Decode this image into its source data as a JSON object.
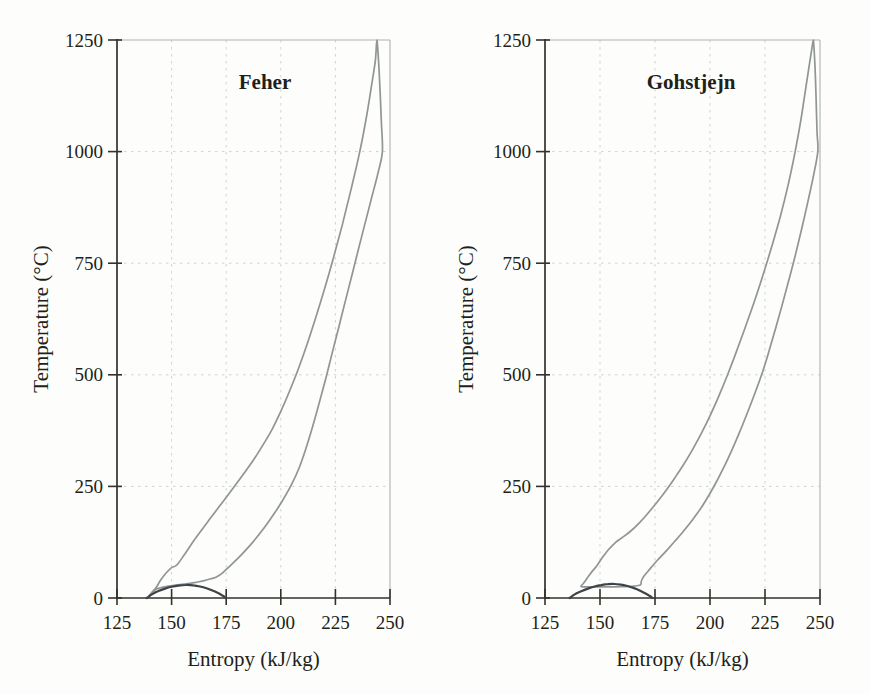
{
  "figure": {
    "background": "#fdfdfb",
    "text_color": "#211f1a",
    "axis_color": "#33312c",
    "frame_color": "#b1b1af",
    "grid_color": "#cdd3d4"
  },
  "chart_data": [
    {
      "type": "line",
      "title": "Feher",
      "xlabel": "Entropy (kJ/kg)",
      "ylabel": "Temperature (°C)",
      "xlim": [
        125,
        250
      ],
      "ylim": [
        0,
        1250
      ],
      "xticks": [
        125,
        150,
        175,
        200,
        225,
        250
      ],
      "yticks": [
        0,
        250,
        500,
        750,
        1000,
        1250
      ],
      "grid": true,
      "legend": false,
      "series": [
        {
          "name": "cycle",
          "color": "#8f9694",
          "width": 1.7,
          "closed": true,
          "points": [
            [
              139.5,
              4
            ],
            [
              141,
              13
            ],
            [
              143,
              24
            ],
            [
              145,
              40
            ],
            [
              147.5,
              56
            ],
            [
              150,
              68
            ],
            [
              152.4,
              74
            ],
            [
              156,
              98
            ],
            [
              160,
              127
            ],
            [
              164,
              154
            ],
            [
              168,
              180
            ],
            [
              172,
              206
            ],
            [
              176,
              232
            ],
            [
              180,
              258
            ],
            [
              184,
              285
            ],
            [
              188,
              313
            ],
            [
              192,
              344
            ],
            [
              196,
              378
            ],
            [
              200,
              418
            ],
            [
              204,
              463
            ],
            [
              208,
              513
            ],
            [
              212,
              568
            ],
            [
              216,
              628
            ],
            [
              220,
              692
            ],
            [
              224,
              760
            ],
            [
              228,
              833
            ],
            [
              232,
              912
            ],
            [
              236,
              996
            ],
            [
              239,
              1072
            ],
            [
              241.5,
              1146
            ],
            [
              243.3,
              1205
            ],
            [
              244,
              1250
            ],
            [
              244.9,
              1190
            ],
            [
              245.5,
              1130
            ],
            [
              246,
              1070
            ],
            [
              246.5,
              1000
            ],
            [
              244.5,
              952
            ],
            [
              241.5,
              895
            ],
            [
              238.5,
              838
            ],
            [
              235.5,
              780
            ],
            [
              232.5,
              722
            ],
            [
              229.5,
              664
            ],
            [
              226.5,
              606
            ],
            [
              223.5,
              548
            ],
            [
              220.5,
              490
            ],
            [
              217.5,
              435
            ],
            [
              214.5,
              383
            ],
            [
              211.5,
              335
            ],
            [
              208.5,
              293
            ],
            [
              205,
              255
            ],
            [
              201,
              220
            ],
            [
              197,
              189
            ],
            [
              193,
              161
            ],
            [
              189,
              136
            ],
            [
              185,
              113
            ],
            [
              181,
              92
            ],
            [
              177,
              73
            ],
            [
              173.5,
              57
            ],
            [
              170.5,
              47
            ],
            [
              168,
              43
            ],
            [
              165,
              39
            ],
            [
              161,
              35
            ],
            [
              157,
              31.8
            ],
            [
              152,
              28.8
            ],
            [
              148,
              26
            ],
            [
              145,
              23
            ],
            [
              143,
              20
            ],
            [
              141.2,
              12
            ]
          ]
        },
        {
          "name": "saturation-dome",
          "color": "#3e4347",
          "width": 2.2,
          "closed": false,
          "points": [
            [
              138.6,
              0
            ],
            [
              141,
              8
            ],
            [
              144,
              15.5
            ],
            [
              147,
              21
            ],
            [
              150,
              25
            ],
            [
              153,
              27.8
            ],
            [
              156.5,
              29.2
            ],
            [
              160,
              28.3
            ],
            [
              163,
              25.8
            ],
            [
              166,
              21.8
            ],
            [
              169,
              16.2
            ],
            [
              171.5,
              10.5
            ],
            [
              173.5,
              5
            ],
            [
              174.8,
              0
            ]
          ]
        }
      ]
    },
    {
      "type": "line",
      "title": "Gohstjejn",
      "xlabel": "Entropy (kJ/kg)",
      "ylabel": "Temperature (°C)",
      "xlim": [
        125,
        250
      ],
      "ylim": [
        0,
        1250
      ],
      "xticks": [
        125,
        150,
        175,
        200,
        225,
        250
      ],
      "yticks": [
        0,
        250,
        500,
        750,
        1000,
        1250
      ],
      "grid": true,
      "legend": false,
      "series": [
        {
          "name": "cycle",
          "color": "#8f9694",
          "width": 1.7,
          "closed": true,
          "points": [
            [
              141.3,
              26
            ],
            [
              142.5,
              33
            ],
            [
              144.5,
              47
            ],
            [
              147,
              63
            ],
            [
              148.5,
              72
            ],
            [
              151,
              90
            ],
            [
              154,
              109
            ],
            [
              157,
              124
            ],
            [
              160,
              135
            ],
            [
              164,
              150
            ],
            [
              168,
              169
            ],
            [
              172,
              191
            ],
            [
              176,
              215
            ],
            [
              180,
              241
            ],
            [
              184,
              269
            ],
            [
              188,
              299
            ],
            [
              192,
              332
            ],
            [
              196,
              368
            ],
            [
              200,
              408
            ],
            [
              204,
              452
            ],
            [
              208,
              500
            ],
            [
              212,
              552
            ],
            [
              216,
              606
            ],
            [
              220,
              662
            ],
            [
              224,
              722
            ],
            [
              228,
              786
            ],
            [
              232,
              855
            ],
            [
              235.5,
              925
            ],
            [
              238.5,
              995
            ],
            [
              241,
              1062
            ],
            [
              243,
              1125
            ],
            [
              245,
              1190
            ],
            [
              246.5,
              1237
            ],
            [
              247,
              1250
            ],
            [
              247.7,
              1195
            ],
            [
              248.1,
              1140
            ],
            [
              248.4,
              1085
            ],
            [
              248.7,
              1040
            ],
            [
              249,
              1000
            ],
            [
              247,
              945
            ],
            [
              244.5,
              888
            ],
            [
              241.8,
              830
            ],
            [
              239,
              772
            ],
            [
              236,
              715
            ],
            [
              233,
              660
            ],
            [
              230,
              607
            ],
            [
              227,
              556
            ],
            [
              224,
              508
            ],
            [
              220.5,
              460
            ],
            [
              217,
              415
            ],
            [
              213.5,
              372
            ],
            [
              210,
              332
            ],
            [
              206.5,
              295
            ],
            [
              203,
              261
            ],
            [
              199.5,
              230
            ],
            [
              196,
              202
            ],
            [
              192,
              175
            ],
            [
              188,
              150
            ],
            [
              184,
              127
            ],
            [
              180,
              105
            ],
            [
              176,
              84
            ],
            [
              172.5,
              64
            ],
            [
              170,
              49
            ],
            [
              168.8,
              38
            ],
            [
              168.3,
              29
            ],
            [
              165,
              26.5
            ],
            [
              160,
              25.5
            ],
            [
              155,
              25
            ],
            [
              150,
              25
            ],
            [
              146,
              25
            ],
            [
              143.5,
              25.2
            ]
          ]
        },
        {
          "name": "saturation-dome",
          "color": "#3e4347",
          "width": 2.2,
          "closed": false,
          "points": [
            [
              136.2,
              0
            ],
            [
              138.5,
              8
            ],
            [
              141.5,
              15
            ],
            [
              144.5,
              21
            ],
            [
              147.5,
              25.8
            ],
            [
              150.5,
              29
            ],
            [
              153.5,
              31
            ],
            [
              156.5,
              31.3
            ],
            [
              159.5,
              29.8
            ],
            [
              162.5,
              26.8
            ],
            [
              165.5,
              22.2
            ],
            [
              168,
              17
            ],
            [
              170.5,
              10.5
            ],
            [
              172.5,
              5
            ],
            [
              173.8,
              0
            ]
          ]
        }
      ]
    }
  ]
}
